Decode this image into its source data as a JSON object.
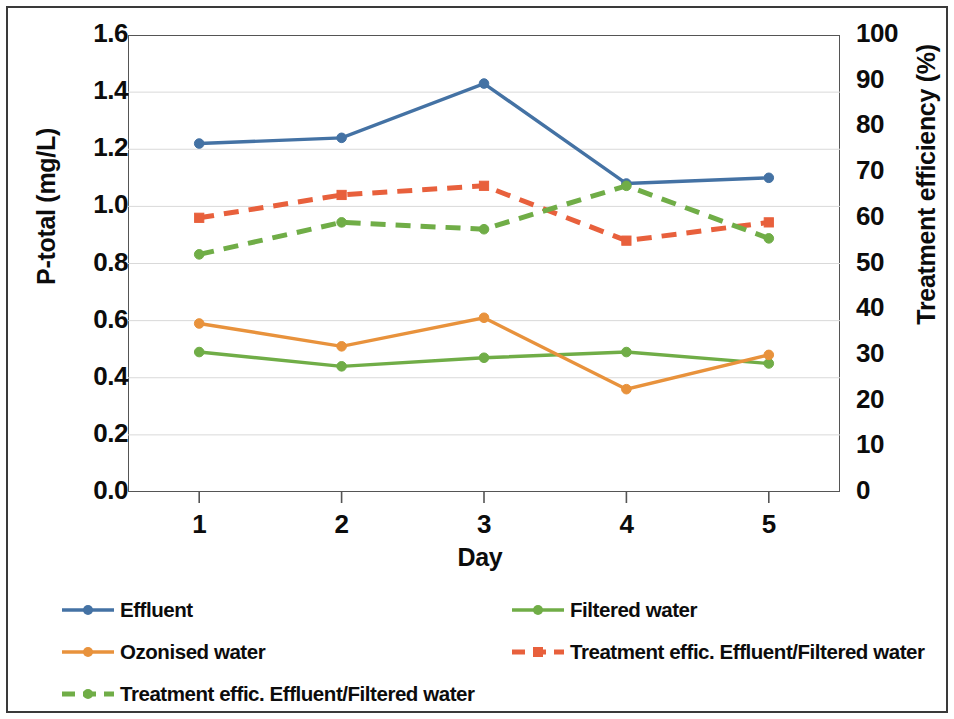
{
  "figure": {
    "background": "#ffffff",
    "frame_color": "#3a3a3a"
  },
  "axes": {
    "left_title": "P-total (mg/L)",
    "right_title": "Treatment efficiency (%)",
    "x_title": "Day"
  },
  "legend": {
    "items": [
      {
        "label": "Effluent",
        "color": "#4472A4",
        "style": "solid",
        "marker": "diamond"
      },
      {
        "label": "Filtered water",
        "color": "#70AD47",
        "style": "solid",
        "marker": "diamond"
      },
      {
        "label": "Ozonised water",
        "color": "#E8923C",
        "style": "solid",
        "marker": "diamond"
      },
      {
        "label": "Treatment effic. Effluent/Filtered water",
        "color": "#E8603C",
        "style": "dashed",
        "marker": "square"
      },
      {
        "label": "Treatment effic. Effluent/Filtered water",
        "color": "#70AD47",
        "style": "dashed",
        "marker": "diamond"
      }
    ]
  },
  "chart_data": {
    "type": "line",
    "title": "",
    "xlabel": "Day",
    "ylabel": "P-total (mg/L)",
    "y2label": "Treatment efficiency (%)",
    "x": [
      1,
      2,
      3,
      4,
      5
    ],
    "xtick_labels": [
      "1",
      "2",
      "3",
      "4",
      "5"
    ],
    "xlim": [
      0.5,
      5.5
    ],
    "ylim": [
      0.0,
      1.6
    ],
    "ytick_labels": [
      "0.0",
      "0.2",
      "0.4",
      "0.6",
      "0.8",
      "1.0",
      "1.2",
      "1.4",
      "1.6"
    ],
    "ytick_values": [
      0.0,
      0.2,
      0.4,
      0.6,
      0.8,
      1.0,
      1.2,
      1.4,
      1.6
    ],
    "y2lim": [
      0,
      100
    ],
    "y2tick_labels": [
      "0",
      "10",
      "20",
      "30",
      "40",
      "50",
      "60",
      "70",
      "80",
      "90",
      "100"
    ],
    "y2tick_values": [
      0,
      10,
      20,
      30,
      40,
      50,
      60,
      70,
      80,
      90,
      100
    ],
    "grid": true,
    "legend_position": "below",
    "series": [
      {
        "name": "Effluent",
        "axis": "left",
        "color": "#4472A4",
        "style": "solid",
        "marker": "diamond",
        "values": [
          1.22,
          1.24,
          1.43,
          1.08,
          1.1
        ]
      },
      {
        "name": "Filtered water",
        "axis": "left",
        "color": "#70AD47",
        "style": "solid",
        "marker": "diamond",
        "values": [
          0.49,
          0.44,
          0.47,
          0.49,
          0.45
        ]
      },
      {
        "name": "Ozonised water",
        "axis": "left",
        "color": "#E8923C",
        "style": "solid",
        "marker": "diamond",
        "values": [
          0.59,
          0.51,
          0.61,
          0.36,
          0.48
        ]
      },
      {
        "name": "Treatment effic. Effluent/Filtered water",
        "axis": "right",
        "color": "#E8603C",
        "style": "dashed",
        "marker": "square",
        "values": [
          60,
          65,
          67,
          55,
          59
        ]
      },
      {
        "name": "Treatment effic. Effluent/Filtered water",
        "axis": "right",
        "color": "#70AD47",
        "style": "dashed",
        "marker": "diamond",
        "values": [
          52,
          59,
          57.5,
          67,
          55.5
        ]
      }
    ]
  }
}
